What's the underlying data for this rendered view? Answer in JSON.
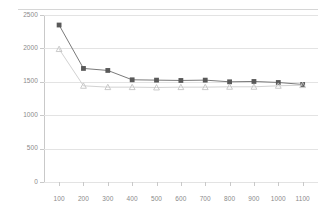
{
  "chart_data": {
    "type": "line",
    "title": "",
    "subtitle": "",
    "xlabel": "",
    "ylabel": "",
    "categories": [
      100,
      200,
      300,
      400,
      500,
      600,
      700,
      800,
      900,
      1000,
      1100
    ],
    "x_tick_labels": [
      "100",
      "200",
      "300",
      "400",
      "500",
      "600",
      "700",
      "800",
      "900",
      "1000",
      "1100"
    ],
    "y_tick_labels": [
      "0",
      "500",
      "1000",
      "1500",
      "2000",
      "2500"
    ],
    "y_ticks": [
      0,
      500,
      1000,
      1500,
      2000,
      2500
    ],
    "ylim": [
      0,
      2500
    ],
    "grid": true,
    "legend": "none",
    "series": [
      {
        "name": "series-1",
        "marker": "square",
        "color": "#595959",
        "line_color": "#7a7a7a",
        "values": [
          2350,
          1700,
          1670,
          1530,
          1525,
          1520,
          1525,
          1500,
          1505,
          1490,
          1460
        ]
      },
      {
        "name": "series-2",
        "marker": "triangle",
        "color": "#c4c4c4",
        "line_color": "#d2d2d2",
        "values": [
          1990,
          1440,
          1420,
          1420,
          1415,
          1420,
          1420,
          1425,
          1425,
          1440,
          1450
        ]
      }
    ]
  },
  "colors": {
    "background": "#ffffff",
    "grid": "#e3e3e3",
    "axis": "#c9c9c9",
    "tick_text": "#8a8a8a",
    "series_1": "#595959",
    "series_2": "#c4c4c4"
  }
}
